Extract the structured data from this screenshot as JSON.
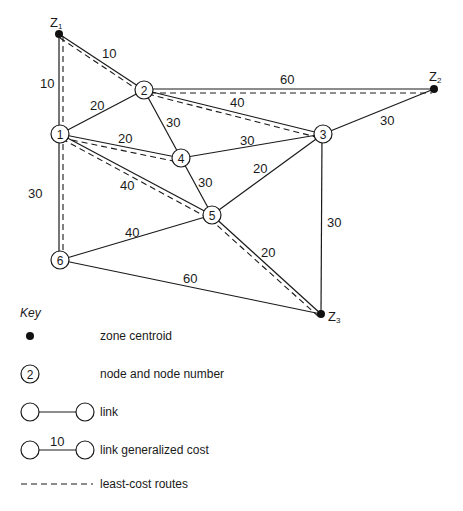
{
  "diagram": {
    "type": "network",
    "centroids": [
      {
        "id": "Z1",
        "label": "Z",
        "sub": "1",
        "x": 59,
        "y": 34
      },
      {
        "id": "Z2",
        "label": "Z",
        "sub": "2",
        "x": 434,
        "y": 89
      },
      {
        "id": "Z3",
        "label": "Z",
        "sub": "3",
        "x": 321,
        "y": 314
      }
    ],
    "nodes": [
      {
        "id": "1",
        "label": "1",
        "x": 60,
        "y": 134
      },
      {
        "id": "2",
        "label": "2",
        "x": 144,
        "y": 90
      },
      {
        "id": "3",
        "label": "3",
        "x": 323,
        "y": 134
      },
      {
        "id": "4",
        "label": "4",
        "x": 181,
        "y": 158
      },
      {
        "id": "5",
        "label": "5",
        "x": 212,
        "y": 215
      },
      {
        "id": "6",
        "label": "6",
        "x": 60,
        "y": 260
      }
    ],
    "links": [
      {
        "from": "Z1",
        "to": "2",
        "cost": "10",
        "least_cost": true
      },
      {
        "from": "Z1",
        "to": "1",
        "cost": "10",
        "least_cost": true
      },
      {
        "from": "1",
        "to": "2",
        "cost": "20",
        "least_cost": false
      },
      {
        "from": "2",
        "to": "Z2",
        "cost": "60",
        "least_cost": true
      },
      {
        "from": "2",
        "to": "3",
        "cost": "40",
        "least_cost": true
      },
      {
        "from": "2",
        "to": "4",
        "cost": "30",
        "least_cost": false
      },
      {
        "from": "1",
        "to": "4",
        "cost": "20",
        "least_cost": true
      },
      {
        "from": "4",
        "to": "3",
        "cost": "30",
        "least_cost": false
      },
      {
        "from": "3",
        "to": "Z2",
        "cost": "30",
        "least_cost": false
      },
      {
        "from": "1",
        "to": "5",
        "cost": "40",
        "least_cost": true
      },
      {
        "from": "4",
        "to": "5",
        "cost": "30",
        "least_cost": false
      },
      {
        "from": "5",
        "to": "3",
        "cost": "20",
        "least_cost": false
      },
      {
        "from": "1",
        "to": "6",
        "cost": "30",
        "least_cost": true
      },
      {
        "from": "6",
        "to": "5",
        "cost": "40",
        "least_cost": false
      },
      {
        "from": "5",
        "to": "Z3",
        "cost": "20",
        "least_cost": true
      },
      {
        "from": "3",
        "to": "Z3",
        "cost": "30",
        "least_cost": false
      },
      {
        "from": "6",
        "to": "Z3",
        "cost": "60",
        "least_cost": false
      }
    ]
  },
  "labels": {
    "z1_main": "Z",
    "z1_sub": "1",
    "z2_main": "Z",
    "z2_sub": "2",
    "z3_main": "Z",
    "z3_sub": "3",
    "n1": "1",
    "n2": "2",
    "n3": "3",
    "n4": "4",
    "n5": "5",
    "n6": "6",
    "c_z1_2": "10",
    "c_z1_1": "10",
    "c_1_2": "20",
    "c_2_z2": "60",
    "c_2_3": "40",
    "c_2_4": "30",
    "c_1_4": "20",
    "c_4_3": "30",
    "c_3_z2": "30",
    "c_1_5": "40",
    "c_4_5": "30",
    "c_5_3": "20",
    "c_1_6": "30",
    "c_6_5": "40",
    "c_5_z3": "20",
    "c_3_z3": "30",
    "c_6_z3": "60"
  },
  "key": {
    "title": "Key",
    "items": [
      {
        "symbol": "filled-dot",
        "text": "zone centroid"
      },
      {
        "symbol": "numbered-circle",
        "sample_number": "2",
        "text": "node and node number"
      },
      {
        "symbol": "circle-line-circle",
        "text": "link"
      },
      {
        "symbol": "circle-line-circle-cost",
        "sample_cost": "10",
        "text": "link generalized cost"
      },
      {
        "symbol": "dashed-line",
        "text": "least-cost routes"
      }
    ]
  }
}
